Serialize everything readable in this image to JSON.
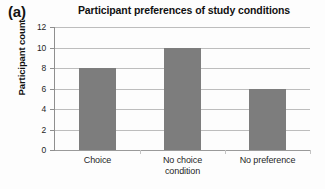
{
  "figure": {
    "panel_label": "(a)"
  },
  "chart_data": {
    "type": "bar",
    "title": "Participant preferences of study conditions",
    "xlabel": "",
    "ylabel": "Participant count",
    "categories": [
      "Choice",
      "No choice condition",
      "No preference"
    ],
    "category_lines": [
      [
        "Choice"
      ],
      [
        "No choice",
        "condition"
      ],
      [
        "No preference"
      ]
    ],
    "values": [
      8,
      10,
      6
    ],
    "ylim": [
      0,
      12
    ],
    "ytick_values": [
      0,
      2,
      4,
      6,
      8,
      10,
      12
    ],
    "ytick_labels": [
      "0",
      "2",
      "4",
      "6",
      "8",
      "10",
      "12"
    ],
    "grid": true,
    "legend": "none",
    "bar_color": "#7d7d7d",
    "gridline_color": "#bdbdbd",
    "axis_color": "#8f8f8f"
  }
}
